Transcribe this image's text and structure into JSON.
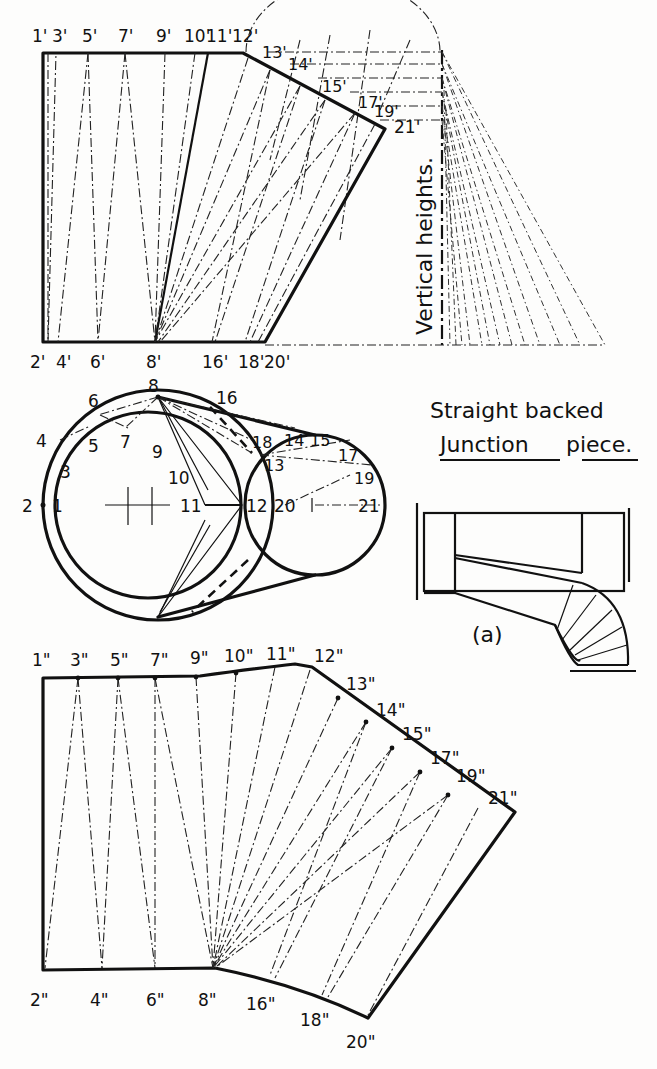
{
  "title": {
    "line1": "Straight backed",
    "line2_underlined": "Junction",
    "line2_rest": "piece."
  },
  "vertical_heights_label": "Vertical heights.",
  "figure_a_label": "(a)",
  "top_development": {
    "top_labels": [
      "1'",
      "3'",
      "5'",
      "7'",
      "9'",
      "10'",
      "11'",
      "12'"
    ],
    "slant_labels": [
      "13'",
      "14'",
      "15'",
      "17'",
      "19'",
      "21'"
    ],
    "bottom_labels": [
      "2'",
      "4'",
      "6'",
      "8'",
      "16'",
      "18'",
      "20'"
    ]
  },
  "plan_view": {
    "big_circle_labels": [
      "2",
      "1",
      "4",
      "3",
      "6",
      "5",
      "8",
      "7",
      "9",
      "10",
      "11"
    ],
    "small_circle_labels": [
      "16",
      "18",
      "14",
      "15",
      "13",
      "17",
      "19",
      "12",
      "20",
      "21"
    ]
  },
  "bottom_pattern": {
    "top_labels": [
      "1\"",
      "3\"",
      "5\"",
      "7\"",
      "9\"",
      "10\"",
      "11\"",
      "12\""
    ],
    "slant_labels": [
      "13\"",
      "14\"",
      "15\"",
      "17\"",
      "19\"",
      "21\""
    ],
    "bottom_labels": [
      "2\"",
      "4\"",
      "6\"",
      "8\"",
      "16\"",
      "18\"",
      "20\""
    ]
  }
}
